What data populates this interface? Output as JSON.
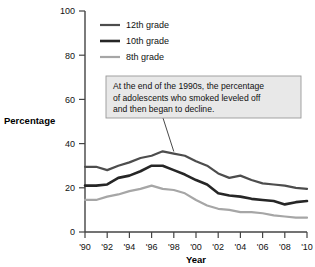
{
  "chart_data": {
    "type": "line",
    "title": "",
    "xlabel": "Year",
    "ylabel": "Percentage",
    "xlim": [
      1990,
      2010
    ],
    "ylim": [
      0,
      100
    ],
    "ytick_values": [
      0,
      20,
      40,
      60,
      80,
      100
    ],
    "ytick_labels": [
      "0",
      "20",
      "40",
      "60",
      "80",
      "100"
    ],
    "xtick_values": [
      1990,
      1992,
      1994,
      1996,
      1998,
      2000,
      2002,
      2004,
      2006,
      2008,
      2010
    ],
    "xtick_labels": [
      "'90",
      "'92",
      "'94",
      "'96",
      "'98",
      "'00",
      "'02",
      "'04",
      "'06",
      "'08",
      "'10"
    ],
    "grid": false,
    "legend_position": "top-left-inside",
    "x": [
      1990,
      1991,
      1992,
      1993,
      1994,
      1995,
      1996,
      1997,
      1998,
      1999,
      2000,
      2001,
      2002,
      2003,
      2004,
      2005,
      2006,
      2007,
      2008,
      2009,
      2010
    ],
    "series": [
      {
        "name": "12th grade",
        "color": "#4d4d4d",
        "width": 2.2,
        "values": [
          29.5,
          29.5,
          28.0,
          30.0,
          31.5,
          33.5,
          34.5,
          36.5,
          35.5,
          34.5,
          32.0,
          30.0,
          26.5,
          24.5,
          25.5,
          23.5,
          22.0,
          21.5,
          21.0,
          20.0,
          19.5
        ]
      },
      {
        "name": "10th grade",
        "color": "#262626",
        "width": 2.6,
        "values": [
          21.0,
          21.0,
          21.5,
          24.5,
          25.5,
          27.5,
          30.0,
          30.0,
          28.0,
          26.0,
          23.5,
          21.5,
          17.5,
          16.5,
          16.0,
          15.0,
          14.5,
          14.0,
          12.5,
          13.5,
          14.0
        ]
      },
      {
        "name": "8th grade",
        "color": "#a6a6a6",
        "width": 2.2,
        "values": [
          14.5,
          14.5,
          16.0,
          17.0,
          18.5,
          19.5,
          21.0,
          19.5,
          19.0,
          17.5,
          14.5,
          12.0,
          10.5,
          10.0,
          9.0,
          9.0,
          8.5,
          7.5,
          7.0,
          6.5,
          6.5
        ]
      }
    ],
    "annotations": [
      {
        "text": "At the end of the 1990s, the percentage of adolescents who smoked leveled off and then began to decline.",
        "lines": [
          "At the end of the 1990s, the percentage",
          "of adolescents who smoked leveled off",
          "and then began to decline."
        ],
        "points_to_x": 1998,
        "points_to_y": 35.5,
        "box_fill": "#e8e8e8",
        "box_border": "#999999"
      }
    ]
  },
  "legend": {
    "items": [
      {
        "label": "12th grade"
      },
      {
        "label": "10th grade"
      },
      {
        "label": "8th grade"
      }
    ]
  },
  "axes": {
    "y_title": "Percentage",
    "x_title": "Year"
  }
}
